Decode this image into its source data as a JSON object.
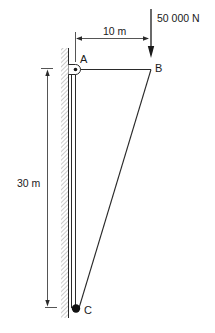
{
  "diagram": {
    "type": "structural-mast-cable",
    "load": {
      "label": "50 000 N",
      "direction": "down"
    },
    "dimensions": {
      "horizontal": {
        "label": "10 m"
      },
      "vertical": {
        "label": "30 m"
      }
    },
    "points": {
      "A": {
        "label": "A",
        "kind": "pin"
      },
      "B": {
        "label": "B",
        "kind": "joint"
      },
      "C": {
        "label": "C",
        "kind": "pin"
      }
    },
    "colors": {
      "ink": "#2a2a2a",
      "background": "#ffffff",
      "hatch": "#9a9a9a"
    }
  }
}
